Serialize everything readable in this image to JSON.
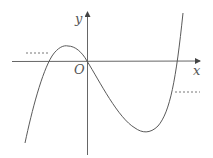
{
  "diagram": {
    "type": "function-graph",
    "labels": {
      "x_axis": "x",
      "y_axis": "y",
      "origin": "O"
    },
    "colors": {
      "stroke": "#5a5a5a",
      "background": "#ffffff"
    },
    "features": {
      "curve": "cubic passing through origin, local max in left half, local min in right half",
      "dotted_levels": [
        "left upper dotted line near local max",
        "right lower dotted line near local min"
      ]
    }
  }
}
